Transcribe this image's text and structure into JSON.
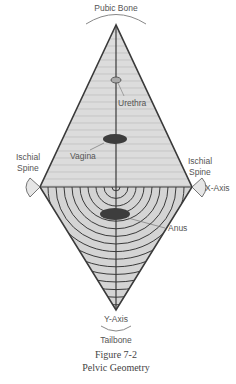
{
  "labels": {
    "top": "Pubic Bone",
    "urethra": "Urethra",
    "vagina": "Vagina",
    "left_spine_1": "Ischial",
    "left_spine_2": "Spine",
    "right_spine_1": "Ischial",
    "right_spine_2": "Spine",
    "x_axis": "X-Axis",
    "anus": "Anus",
    "y_axis": "Y-Axis",
    "bottom": "Tailbone"
  },
  "caption": {
    "figure": "Figure 7-2",
    "title": "Pelvic Geometry"
  },
  "colors": {
    "fill": "#d9d9d9",
    "line": "#444444",
    "organ": "#3d3d3d",
    "hatch": "#bdbdbd"
  }
}
